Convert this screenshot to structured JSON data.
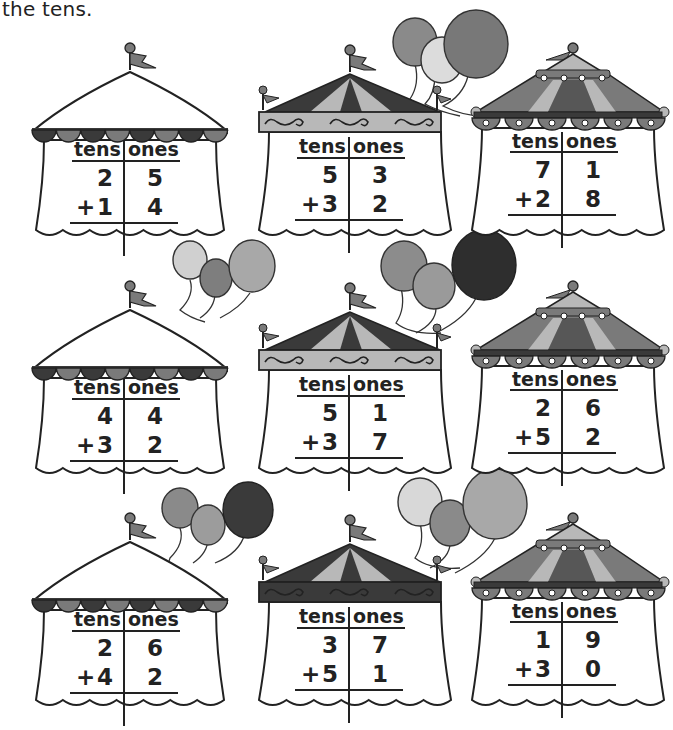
{
  "instruction": "the tens.",
  "column_headers": {
    "tens": "tens",
    "ones": "ones"
  },
  "operator": "+",
  "problems": [
    {
      "top_tens": "2",
      "top_ones": "5",
      "bottom_tens": "1",
      "bottom_ones": "4",
      "style": "scallop"
    },
    {
      "top_tens": "5",
      "top_ones": "3",
      "bottom_tens": "3",
      "bottom_ones": "2",
      "style": "swirl-light"
    },
    {
      "top_tens": "7",
      "top_ones": "1",
      "bottom_tens": "2",
      "bottom_ones": "8",
      "style": "dome"
    },
    {
      "top_tens": "4",
      "top_ones": "4",
      "bottom_tens": "3",
      "bottom_ones": "2",
      "style": "scallop"
    },
    {
      "top_tens": "5",
      "top_ones": "1",
      "bottom_tens": "3",
      "bottom_ones": "7",
      "style": "swirl-light"
    },
    {
      "top_tens": "2",
      "top_ones": "6",
      "bottom_tens": "5",
      "bottom_ones": "2",
      "style": "dome"
    },
    {
      "top_tens": "2",
      "top_ones": "6",
      "bottom_tens": "4",
      "bottom_ones": "2",
      "style": "scallop"
    },
    {
      "top_tens": "3",
      "top_ones": "7",
      "bottom_tens": "5",
      "bottom_ones": "1",
      "style": "swirl-dark"
    },
    {
      "top_tens": "1",
      "top_ones": "9",
      "bottom_tens": "3",
      "bottom_ones": "0",
      "style": "dome"
    }
  ],
  "colors": {
    "ink": "#222222",
    "dark": "#3a3a3a",
    "mid": "#7a7a7a",
    "light": "#b8b8b8",
    "pale": "#e2e2e2"
  }
}
